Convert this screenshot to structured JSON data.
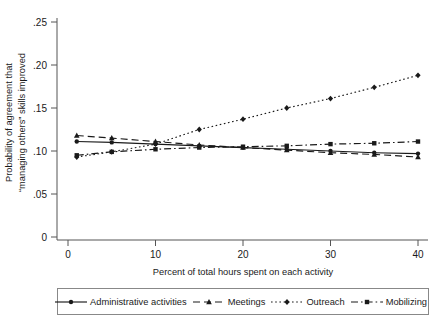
{
  "chart_data": {
    "type": "line",
    "title": "",
    "xlabel": "Percent of total hours spent on each activity",
    "ylabel_line1": "Probability of agreement that",
    "ylabel_line2": "“managing others” skills improved",
    "x": [
      1,
      5,
      10,
      15,
      20,
      25,
      30,
      35,
      40
    ],
    "xlim": [
      0,
      41
    ],
    "ylim": [
      0,
      0.26
    ],
    "xticks": [
      0,
      10,
      20,
      30,
      40
    ],
    "xtick_labels": [
      "0",
      "10",
      "20",
      "30",
      "40"
    ],
    "yticks": [
      0,
      0.05,
      0.1,
      0.15,
      0.2,
      0.25
    ],
    "ytick_labels": [
      "0",
      ".05",
      ".10",
      ".15",
      ".20",
      ".25"
    ],
    "grid": false,
    "legend_position": "bottom",
    "series": [
      {
        "name": "Administrative activities",
        "marker": "circle",
        "dash": "solid",
        "color": "#1a1a1a",
        "values": [
          0.111,
          0.11,
          0.108,
          0.106,
          0.104,
          0.102,
          0.1,
          0.098,
          0.097
        ]
      },
      {
        "name": "Meetings",
        "marker": "triangle",
        "dash": "dashed",
        "color": "#1a1a1a",
        "values": [
          0.118,
          0.115,
          0.111,
          0.107,
          0.104,
          0.101,
          0.098,
          0.096,
          0.093
        ]
      },
      {
        "name": "Outreach",
        "marker": "diamond",
        "dash": "dotted",
        "color": "#1a1a1a",
        "values": [
          0.093,
          0.099,
          0.108,
          0.125,
          0.137,
          0.15,
          0.161,
          0.174,
          0.188
        ]
      },
      {
        "name": "Mobilizing",
        "marker": "square",
        "dash": "dashdot",
        "color": "#1a1a1a",
        "values": [
          0.095,
          0.099,
          0.102,
          0.104,
          0.105,
          0.106,
          0.108,
          0.109,
          0.111
        ]
      }
    ]
  },
  "legend": {
    "items": [
      {
        "label": "Administrative activities",
        "marker": "circle",
        "dash": "solid"
      },
      {
        "label": "Meetings",
        "marker": "triangle",
        "dash": "dashed"
      },
      {
        "label": "Outreach",
        "marker": "diamond",
        "dash": "dotted"
      },
      {
        "label": "Mobilizing",
        "marker": "square",
        "dash": "dashdot"
      }
    ]
  }
}
